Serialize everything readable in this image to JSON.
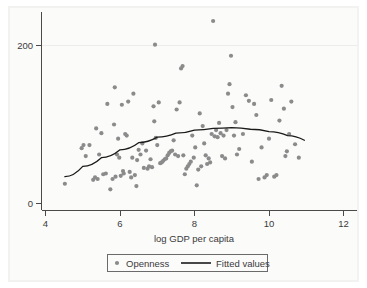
{
  "chart_data": {
    "type": "scatter",
    "title": "",
    "subtitle": "",
    "xlabel": "log GDP per capita",
    "ylabel": "",
    "xlim": [
      4,
      12
    ],
    "ylim": [
      0,
      240
    ],
    "grid": "horizontal-light",
    "xticks": [
      4,
      6,
      8,
      10,
      12
    ],
    "xtick_labels": [
      "4",
      "6",
      "8",
      "10",
      "12"
    ],
    "yticks": [
      0,
      200
    ],
    "ytick_labels": [
      "0",
      "200"
    ],
    "legend": {
      "position": "bottom-center",
      "entries": [
        {
          "label": "Openness",
          "marker": "circle",
          "color": "#8b8b8b"
        },
        {
          "label": "Fitted values",
          "marker": "line",
          "color": "#1a1a1a"
        }
      ]
    },
    "series": [
      {
        "name": "Openness",
        "type": "scatter",
        "color": "#8b8b8b",
        "points": [
          [
            4.52,
            25
          ],
          [
            4.97,
            70
          ],
          [
            5.02,
            74
          ],
          [
            5.08,
            60
          ],
          [
            5.18,
            74
          ],
          [
            5.28,
            30
          ],
          [
            5.33,
            33
          ],
          [
            5.36,
            95
          ],
          [
            5.4,
            31
          ],
          [
            5.44,
            62
          ],
          [
            5.5,
            89
          ],
          [
            5.55,
            37
          ],
          [
            5.62,
            38
          ],
          [
            5.66,
            126
          ],
          [
            5.74,
            18
          ],
          [
            5.8,
            31
          ],
          [
            5.84,
            100
          ],
          [
            5.86,
            147
          ],
          [
            5.88,
            34
          ],
          [
            5.92,
            62
          ],
          [
            5.95,
            82
          ],
          [
            5.98,
            58
          ],
          [
            6.02,
            35
          ],
          [
            6.05,
            125
          ],
          [
            6.08,
            41
          ],
          [
            6.1,
            38
          ],
          [
            6.14,
            88
          ],
          [
            6.18,
            86
          ],
          [
            6.22,
            129
          ],
          [
            6.26,
            40
          ],
          [
            6.3,
            33
          ],
          [
            6.33,
            58
          ],
          [
            6.36,
            139
          ],
          [
            6.4,
            36
          ],
          [
            6.44,
            22
          ],
          [
            6.46,
            55
          ],
          [
            6.5,
            68
          ],
          [
            6.55,
            62
          ],
          [
            6.6,
            76
          ],
          [
            6.64,
            45
          ],
          [
            6.7,
            67
          ],
          [
            6.74,
            44
          ],
          [
            6.78,
            47
          ],
          [
            6.82,
            56
          ],
          [
            6.86,
            46
          ],
          [
            6.9,
            123
          ],
          [
            6.92,
            104
          ],
          [
            6.94,
            201
          ],
          [
            6.96,
            83
          ],
          [
            7.0,
            74
          ],
          [
            7.04,
            128
          ],
          [
            7.08,
            51
          ],
          [
            7.12,
            52
          ],
          [
            7.16,
            54
          ],
          [
            7.2,
            56
          ],
          [
            7.24,
            57
          ],
          [
            7.28,
            61
          ],
          [
            7.32,
            64
          ],
          [
            7.36,
            66
          ],
          [
            7.4,
            67
          ],
          [
            7.44,
            80
          ],
          [
            7.48,
            62
          ],
          [
            7.52,
            119
          ],
          [
            7.56,
            60
          ],
          [
            7.6,
            128
          ],
          [
            7.64,
            171
          ],
          [
            7.68,
            174
          ],
          [
            7.7,
            61
          ],
          [
            7.74,
            37
          ],
          [
            7.78,
            44
          ],
          [
            7.82,
            47
          ],
          [
            7.86,
            50
          ],
          [
            7.9,
            53
          ],
          [
            7.94,
            86
          ],
          [
            7.98,
            58
          ],
          [
            8.02,
            71
          ],
          [
            8.06,
            23
          ],
          [
            8.1,
            43
          ],
          [
            8.14,
            114
          ],
          [
            8.18,
            47
          ],
          [
            8.22,
            98
          ],
          [
            8.26,
            76
          ],
          [
            8.3,
            61
          ],
          [
            8.34,
            50
          ],
          [
            8.38,
            57
          ],
          [
            8.42,
            52
          ],
          [
            8.46,
            88
          ],
          [
            8.5,
            231
          ],
          [
            8.54,
            85
          ],
          [
            8.58,
            93
          ],
          [
            8.62,
            84
          ],
          [
            8.66,
            102
          ],
          [
            8.7,
            89
          ],
          [
            8.74,
            60
          ],
          [
            8.78,
            86
          ],
          [
            8.82,
            57
          ],
          [
            8.86,
            93
          ],
          [
            8.9,
            139
          ],
          [
            8.94,
            151
          ],
          [
            8.98,
            187
          ],
          [
            9.02,
            122
          ],
          [
            9.06,
            86
          ],
          [
            9.1,
            103
          ],
          [
            9.14,
            62
          ],
          [
            9.2,
            69
          ],
          [
            9.3,
            88
          ],
          [
            9.38,
            137
          ],
          [
            9.46,
            130
          ],
          [
            9.54,
            53
          ],
          [
            9.6,
            126
          ],
          [
            9.66,
            112
          ],
          [
            9.72,
            31
          ],
          [
            9.8,
            71
          ],
          [
            9.88,
            33
          ],
          [
            9.94,
            36
          ],
          [
            10.0,
            82
          ],
          [
            10.06,
            131
          ],
          [
            10.14,
            34
          ],
          [
            10.2,
            36
          ],
          [
            10.28,
            105
          ],
          [
            10.34,
            149
          ],
          [
            10.4,
            120
          ],
          [
            10.44,
            60
          ],
          [
            10.48,
            66
          ],
          [
            10.54,
            88
          ],
          [
            10.6,
            129
          ],
          [
            10.7,
            75
          ],
          [
            10.8,
            58
          ]
        ]
      },
      {
        "name": "Fitted values",
        "type": "line",
        "color": "#1a1a1a",
        "description": "Concave quadratic fit peaking near log GDP per capita 9",
        "points": [
          [
            4.52,
            34
          ],
          [
            5.0,
            47
          ],
          [
            5.5,
            58
          ],
          [
            6.0,
            68
          ],
          [
            6.5,
            77
          ],
          [
            7.0,
            84
          ],
          [
            7.5,
            89
          ],
          [
            8.0,
            93
          ],
          [
            8.5,
            95
          ],
          [
            9.0,
            96
          ],
          [
            9.5,
            94
          ],
          [
            10.0,
            91
          ],
          [
            10.5,
            86
          ],
          [
            10.95,
            80
          ]
        ]
      }
    ]
  }
}
